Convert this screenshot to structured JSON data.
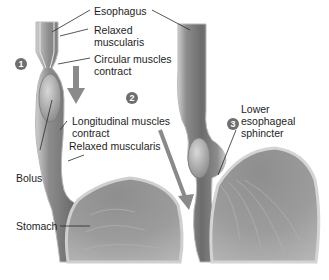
{
  "figure": {
    "steps": [
      {
        "number": "1"
      },
      {
        "number": "2"
      },
      {
        "number": "3"
      }
    ],
    "labels": {
      "esophagus": "Esophagus",
      "relaxed_muscularis_top_1": "Relaxed",
      "relaxed_muscularis_top_2": "muscularis",
      "circular_1": "Circular muscles",
      "circular_2": "contract",
      "longitudinal_1": "Longitudinal muscles",
      "longitudinal_2": "contract",
      "relaxed_muscularis_bottom": "Relaxed muscularis",
      "bolus": "Bolus",
      "stomach": "Stomach",
      "les_1": "Lower",
      "les_2": "esophageal",
      "les_3": "sphincter"
    },
    "colors": {
      "tissue_dark": "#6f6f6f",
      "tissue_mid": "#9a9a9a",
      "tissue_light": "#d2d2d2",
      "arrow": "#8a8a8a",
      "step_badge": "#6e6e6e"
    }
  }
}
